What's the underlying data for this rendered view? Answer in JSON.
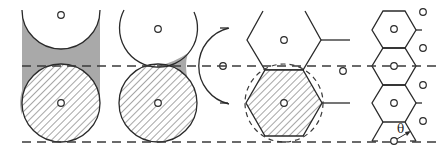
{
  "figure": {
    "colors": {
      "stroke": "#2a2a2a",
      "shaded_gap": "#a9a9a9",
      "background": "#ffffff"
    },
    "dashed_lines_y": [
      66,
      142
    ],
    "panels": [
      {
        "id": "square-circle-packing",
        "shape": "circle",
        "hatched": "bottom circle",
        "shaded": "gap between circles"
      },
      {
        "id": "triangular-circle-packing",
        "shape": "circle",
        "hatched": "bottom circle",
        "shaded": "interstitial triangle"
      },
      {
        "id": "hexagon-with-circumcircle",
        "shape": "hexagon",
        "hatched": "lower hexagon",
        "dashed_circle": true
      },
      {
        "id": "hexagon-column",
        "shape": "hexagon",
        "annotation": "angle"
      }
    ],
    "angle_label": "θ"
  }
}
